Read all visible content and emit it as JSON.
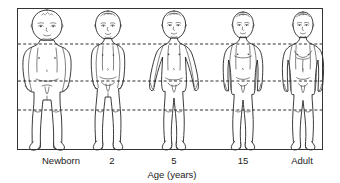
{
  "diagram": {
    "axis_title": "Age (years)",
    "frame": {
      "x": 17,
      "y": 8,
      "width": 306,
      "height": 142,
      "stroke": "#333333"
    },
    "background": "#ffffff",
    "reference_lines": [
      {
        "name": "shoulder-line",
        "y": 44,
        "style": "dashed"
      },
      {
        "name": "pelvis-line",
        "y": 81,
        "style": "dashed"
      },
      {
        "name": "knee-line",
        "y": 110,
        "style": "dashed"
      }
    ],
    "figures": [
      {
        "label": "Newborn",
        "label_x": 61,
        "center_x": 47,
        "head_top": 10,
        "head_bottom": 41,
        "head_width": 31,
        "foot_y": 148,
        "head_to_body_ratio": "1:4"
      },
      {
        "label": "2",
        "label_x": 112,
        "center_x": 108,
        "head_top": 11,
        "head_bottom": 39,
        "head_width": 25,
        "foot_y": 148,
        "head_to_body_ratio": "1:5"
      },
      {
        "label": "5",
        "label_x": 174,
        "center_x": 174,
        "head_top": 11,
        "head_bottom": 38,
        "head_width": 23,
        "foot_y": 148,
        "head_to_body_ratio": "1:6"
      },
      {
        "label": "15",
        "label_x": 243,
        "center_x": 243,
        "head_top": 12,
        "head_bottom": 38,
        "head_width": 20,
        "foot_y": 148,
        "head_to_body_ratio": "1:7"
      },
      {
        "label": "Adult",
        "label_x": 302,
        "center_x": 303,
        "head_top": 12,
        "head_bottom": 38,
        "head_width": 19,
        "foot_y": 148,
        "head_to_body_ratio": "1:7.5"
      }
    ],
    "labels_y": 161,
    "axis_title_y": 176,
    "axis_title_x": 172
  }
}
